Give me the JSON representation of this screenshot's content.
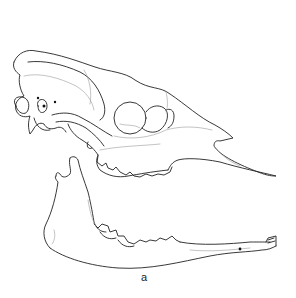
{
  "figure": {
    "panel_label": "a",
    "colors": {
      "background": "#ffffff",
      "line": "#222222",
      "suture": "#9a9a9a"
    }
  }
}
